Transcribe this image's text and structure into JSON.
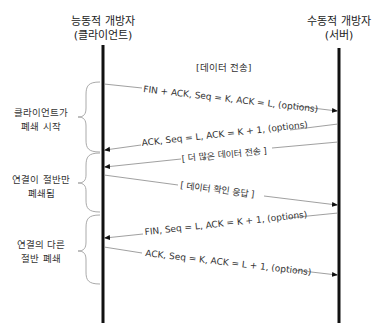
{
  "participants": {
    "left": {
      "line1": "능동적 개방자",
      "line2": "(클라이언트)"
    },
    "right": {
      "line1": "수동적 개방자",
      "line2": "(서버)"
    }
  },
  "section_label": "[데이터 전송]",
  "messages": [
    {
      "direction": "left-to-right",
      "label": "FIN + ACK, Seq = K, ACK = L, (options)"
    },
    {
      "direction": "right-to-left",
      "label": "ACK, Seq = L, ACK = K + 1, (options)"
    },
    {
      "direction": "right-to-left",
      "label": "[ 더 많은 데이터 전송 ]"
    },
    {
      "direction": "left-to-right",
      "label": "[ 데이터 확인 응답 ]"
    },
    {
      "direction": "right-to-left",
      "label": "FIN, Seq = L, ACK = K + 1, (options)"
    },
    {
      "direction": "left-to-right",
      "label": "ACK, Seq = K, ACK = L + 1, (options)"
    }
  ],
  "phases": [
    {
      "line1": "클라이언트가",
      "line2": "폐쇄 시작"
    },
    {
      "line1": "연결이 절반만",
      "line2": "폐쇄됨"
    },
    {
      "line1": "연결의 다른",
      "line2": "절반 폐쇄"
    }
  ],
  "colors": {
    "lifeline": "#111111",
    "message_line": "#888888",
    "brace": "#aaaaaa",
    "text": "#333333"
  }
}
